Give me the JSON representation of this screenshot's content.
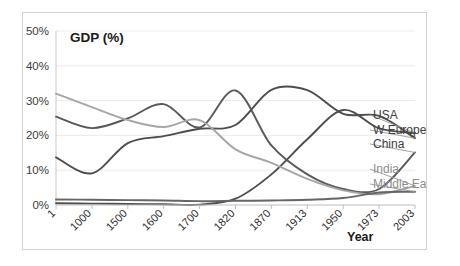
{
  "chart_data": {
    "type": "line",
    "title": "GDP (%)",
    "xlabel": "Year",
    "ylabel": "",
    "categories": [
      "1",
      "1000",
      "1500",
      "1600",
      "1700",
      "1820",
      "1870",
      "1913",
      "1950",
      "1973",
      "2003"
    ],
    "ytick_labels": [
      "0%",
      "10%",
      "20%",
      "30%",
      "40%",
      "50%"
    ],
    "ytick_values": [
      0,
      10,
      20,
      30,
      40,
      50
    ],
    "ylim": [
      0,
      50
    ],
    "grid": true,
    "legend_position": "right-inline",
    "series": [
      {
        "name": "USA",
        "color": "#4d4d4d",
        "values": [
          0.5,
          0.4,
          0.3,
          0.2,
          0.1,
          1.8,
          8.8,
          18.9,
          27.3,
          22.0,
          20.7
        ]
      },
      {
        "name": "W Europe",
        "color": "#4d4d4d",
        "values": [
          13.7,
          9.1,
          17.8,
          19.8,
          21.9,
          23.0,
          33.1,
          33.0,
          26.2,
          25.6,
          19.2
        ]
      },
      {
        "name": "China",
        "color": "#595959",
        "values": [
          25.4,
          22.1,
          24.9,
          29.0,
          22.3,
          32.9,
          17.1,
          8.8,
          4.6,
          4.6,
          15.1
        ]
      },
      {
        "name": "India",
        "color": "#a6a6a6",
        "values": [
          32.0,
          28.1,
          24.4,
          22.4,
          24.4,
          16.0,
          12.1,
          7.5,
          4.2,
          3.1,
          5.5
        ]
      },
      {
        "name": "Middle East",
        "color": "#666666",
        "values": [
          1.6,
          1.5,
          1.4,
          1.3,
          1.1,
          1.2,
          1.3,
          1.5,
          2.0,
          3.6,
          3.8
        ]
      }
    ]
  },
  "legend": {
    "items": [
      {
        "label": "USA",
        "tone": "dark"
      },
      {
        "label": "W Europe",
        "tone": "dark"
      },
      {
        "label": "China",
        "tone": "dark"
      },
      {
        "label": "India",
        "tone": "light"
      },
      {
        "label": "Middle East",
        "tone": "light"
      }
    ]
  }
}
